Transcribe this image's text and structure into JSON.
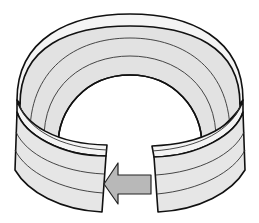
{
  "figure": {
    "colors": {
      "band_inner_face": "#e2e2e2",
      "band_rim": "#f4f4f4",
      "band_front_face": "#e6e6e6",
      "outline": "#111111",
      "arrow_fill": "#b8b8b8",
      "background": "#ffffff"
    },
    "arrow": {
      "direction": "left"
    }
  }
}
